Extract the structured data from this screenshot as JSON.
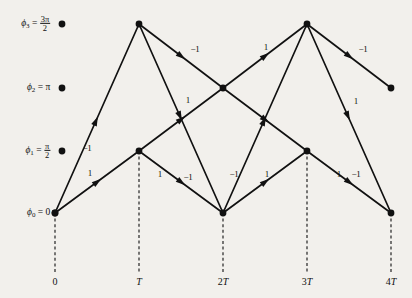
{
  "figure": {
    "type": "phase-trellis-diagram",
    "background_color": "#f2f0ec",
    "line_color": "#111111",
    "width": 412,
    "height": 298
  },
  "phase_axis": {
    "name": "phase-states",
    "states": [
      {
        "id": "phi3",
        "symbol": "ϕ",
        "index": "3",
        "eq": "=",
        "value_kind": "fraction",
        "numerator": "3π",
        "denominator": "2",
        "value_text": "3π/2",
        "y": 24
      },
      {
        "id": "phi2",
        "symbol": "ϕ",
        "index": "2",
        "eq": "=",
        "value_kind": "plain",
        "value_text": "π",
        "y": 88
      },
      {
        "id": "phi1",
        "symbol": "ϕ",
        "index": "1",
        "eq": "=",
        "value_kind": "fraction",
        "numerator": "π",
        "denominator": "2",
        "value_text": "π/2",
        "y": 151
      },
      {
        "id": "phi0",
        "symbol": "ϕ",
        "index": "0",
        "eq": "=",
        "value_kind": "plain",
        "value_text": "0",
        "y": 213
      }
    ]
  },
  "time_axis": {
    "name": "time-axis",
    "ticks": [
      {
        "id": "t0",
        "label": "0",
        "mult": "",
        "base": "0",
        "italic": false,
        "x": 55
      },
      {
        "id": "t1",
        "label": "T",
        "mult": "",
        "base": "T",
        "italic": true,
        "x": 139
      },
      {
        "id": "t2",
        "label": "2T",
        "mult": "2",
        "base": "T",
        "italic": true,
        "x": 223
      },
      {
        "id": "t3",
        "label": "3T",
        "mult": "3",
        "base": "T",
        "italic": true,
        "x": 307
      },
      {
        "id": "t4",
        "label": "4T",
        "mult": "4",
        "base": "T",
        "italic": true,
        "x": 391
      }
    ]
  },
  "nodes": [
    {
      "id": "n_0_phi0",
      "time": "0",
      "state": "phi0",
      "x": 55,
      "y": 213
    },
    {
      "id": "n_T_phi3",
      "time": "T",
      "state": "phi3",
      "x": 139,
      "y": 24
    },
    {
      "id": "n_T_phi1",
      "time": "T",
      "state": "phi1",
      "x": 139,
      "y": 151
    },
    {
      "id": "n_2T_phi2",
      "time": "2T",
      "state": "phi2",
      "x": 223,
      "y": 88
    },
    {
      "id": "n_2T_phi0",
      "time": "2T",
      "state": "phi0",
      "x": 223,
      "y": 213
    },
    {
      "id": "n_3T_phi3",
      "time": "3T",
      "state": "phi3",
      "x": 307,
      "y": 24
    },
    {
      "id": "n_3T_phi1",
      "time": "3T",
      "state": "phi1",
      "x": 307,
      "y": 151
    },
    {
      "id": "n_4T_phi2",
      "time": "4T",
      "state": "phi2",
      "x": 391,
      "y": 88
    },
    {
      "id": "n_4T_phi0",
      "time": "4T",
      "state": "phi0",
      "x": 391,
      "y": 213
    }
  ],
  "axis_dots": [
    {
      "id": "dot-phi3",
      "x": 62,
      "y": 24
    },
    {
      "id": "dot-phi2",
      "x": 62,
      "y": 88
    },
    {
      "id": "dot-phi1",
      "x": 62,
      "y": 151
    },
    {
      "id": "dot-phi0",
      "x": 55,
      "y": 213
    }
  ],
  "edges": [
    {
      "id": "e1",
      "from": "n_0_phi0",
      "to": "n_T_phi3",
      "x1": 55,
      "y1": 213,
      "x2": 139,
      "y2": 24,
      "weight": "-1",
      "label": "−1",
      "lx": 87,
      "ly": 148
    },
    {
      "id": "e2",
      "from": "n_0_phi0",
      "to": "n_T_phi1",
      "x1": 55,
      "y1": 213,
      "x2": 139,
      "y2": 151,
      "weight": "1",
      "label": "1",
      "lx": 90,
      "ly": 173
    },
    {
      "id": "e3",
      "from": "n_T_phi3",
      "to": "n_2T_phi2",
      "x1": 139,
      "y1": 24,
      "x2": 223,
      "y2": 88,
      "weight": "-1",
      "label": "−1",
      "lx": 195,
      "ly": 49
    },
    {
      "id": "e4",
      "from": "n_T_phi3",
      "to": "n_2T_phi0",
      "x1": 139,
      "y1": 24,
      "x2": 223,
      "y2": 213,
      "weight": "-1",
      "label": "−1",
      "lx": 234,
      "ly": 174
    },
    {
      "id": "e5",
      "from": "n_T_phi1",
      "to": "n_2T_phi2",
      "x1": 139,
      "y1": 151,
      "x2": 223,
      "y2": 88,
      "weight": "1",
      "label": "1",
      "lx": 188,
      "ly": 100
    },
    {
      "id": "e6",
      "from": "n_T_phi1",
      "to": "n_2T_phi0",
      "x1": 139,
      "y1": 151,
      "x2": 223,
      "y2": 213,
      "weight": "-1",
      "label": "−1",
      "lx": 188,
      "ly": 177
    },
    {
      "id": "e7",
      "from": "n_2T_phi2",
      "to": "n_3T_phi3",
      "x1": 223,
      "y1": 88,
      "x2": 307,
      "y2": 24,
      "weight": "1",
      "label": "1",
      "lx": 266,
      "ly": 47
    },
    {
      "id": "e8",
      "from": "n_2T_phi2",
      "to": "n_3T_phi1",
      "x1": 223,
      "y1": 88,
      "x2": 307,
      "y2": 151,
      "weight": "1",
      "label": "1",
      "lx": 356,
      "ly": 101
    },
    {
      "id": "e9",
      "from": "n_2T_phi0",
      "to": "n_3T_phi3",
      "x1": 223,
      "y1": 213,
      "x2": 307,
      "y2": 24,
      "weight": "1",
      "label": "1",
      "lx": 160,
      "ly": 174
    },
    {
      "id": "e10",
      "from": "n_2T_phi0",
      "to": "n_3T_phi1",
      "x1": 223,
      "y1": 213,
      "x2": 307,
      "y2": 151,
      "weight": "1",
      "label": "1",
      "lx": 267,
      "ly": 174
    },
    {
      "id": "e11",
      "from": "n_3T_phi3",
      "to": "n_4T_phi2",
      "x1": 307,
      "y1": 24,
      "x2": 391,
      "y2": 88,
      "weight": "-1",
      "label": "−1",
      "lx": 363,
      "ly": 49
    },
    {
      "id": "e12",
      "from": "n_3T_phi3",
      "to": "n_4T_phi0",
      "x1": 307,
      "y1": 24,
      "x2": 391,
      "y2": 213,
      "weight": "1",
      "label": "1",
      "lx": 339,
      "ly": 174
    },
    {
      "id": "e13",
      "from": "n_3T_phi1",
      "to": "n_4T_phi0",
      "x1": 307,
      "y1": 151,
      "x2": 391,
      "y2": 213,
      "weight": "-1",
      "label": "−1",
      "lx": 356,
      "ly": 174
    }
  ],
  "dashed_drops": [
    {
      "id": "drop-0",
      "x": 55,
      "y1": 213,
      "y2": 272
    },
    {
      "id": "drop-T",
      "x": 139,
      "y1": 151,
      "y2": 272
    },
    {
      "id": "drop-2T",
      "x": 223,
      "y1": 213,
      "y2": 272
    },
    {
      "id": "drop-3T",
      "x": 307,
      "y1": 151,
      "y2": 272
    },
    {
      "id": "drop-4T",
      "x": 391,
      "y1": 213,
      "y2": 272
    }
  ]
}
